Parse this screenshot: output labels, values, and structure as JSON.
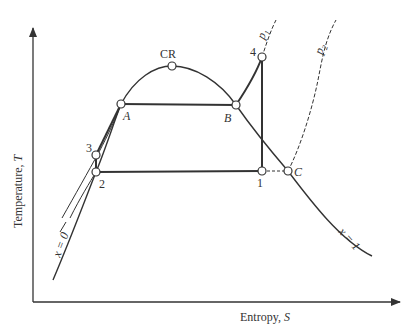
{
  "diagram": {
    "type": "T-S diagram (Rankine cycle with saturation dome)",
    "axes": {
      "y_label": "Temperature, ",
      "y_symbol": "T",
      "x_label": "Entropy, ",
      "x_symbol": "S"
    },
    "points": [
      {
        "id": "CR",
        "label": "CR"
      },
      {
        "id": "A",
        "label": "A"
      },
      {
        "id": "B",
        "label": "B"
      },
      {
        "id": "1",
        "label": "1"
      },
      {
        "id": "2",
        "label": "2"
      },
      {
        "id": "3",
        "label": "3"
      },
      {
        "id": "4",
        "label": "4"
      },
      {
        "id": "C",
        "label": "C"
      }
    ],
    "curves": {
      "p1": "p",
      "p1_sub": "1",
      "p2": "p",
      "p2_sub": "2",
      "x0": "x = 0",
      "x1": "x = 1"
    },
    "colors": {
      "line": "#333333",
      "background": "#ffffff"
    }
  }
}
